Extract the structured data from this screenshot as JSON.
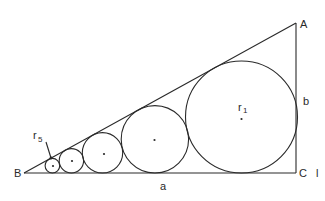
{
  "diagram": {
    "vertices": {
      "A": {
        "label": "A",
        "x": 296,
        "y": 23
      },
      "B": {
        "label": "B",
        "x": 24,
        "y": 173
      },
      "C": {
        "label": "C",
        "x": 296,
        "y": 173
      }
    },
    "sides": {
      "a": {
        "label": "a"
      },
      "b": {
        "label": "b"
      }
    },
    "extra_label": "l",
    "circles": [
      {
        "name": "r1",
        "cx": 241.5,
        "cy": 117,
        "r": 56,
        "label": "r",
        "subscript": "1"
      },
      {
        "name": "r2",
        "cx": 154.9,
        "cy": 139.3,
        "r": 33.7
      },
      {
        "name": "r3",
        "cx": 102.5,
        "cy": 152.8,
        "r": 20.2
      },
      {
        "name": "r4",
        "cx": 71.4,
        "cy": 160.8,
        "r": 12.2
      },
      {
        "name": "r5",
        "cx": 52.4,
        "cy": 165.7,
        "r": 7.3,
        "label": "r",
        "subscript": "5"
      }
    ],
    "colors": {
      "line": "#2a2a2a",
      "background": "#ffffff"
    }
  }
}
